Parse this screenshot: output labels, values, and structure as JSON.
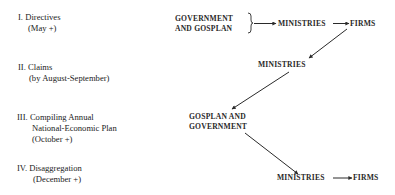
{
  "stages": [
    {
      "numeral": "I.",
      "title": "Directives",
      "timing": [
        "(May +)"
      ]
    },
    {
      "numeral": "II.",
      "title": "Claims",
      "timing": [
        "(by August-September)"
      ]
    },
    {
      "numeral": "III.",
      "title": "Compiling Annual",
      "timing": [
        "National-Economic Plan",
        "(October +)"
      ]
    },
    {
      "numeral": "IV.",
      "title": "Disaggregation",
      "timing": [
        "(December +)"
      ]
    }
  ],
  "nodes": {
    "gov_gosplan_line1": "GOVERNMENT",
    "gov_gosplan_line2": "AND GOSPLAN",
    "ministries_1": "MINISTRIES",
    "firms_1": "FIRMS",
    "ministries_2": "MINISTRIES",
    "gosplan_gov_line1": "GOSPLAN AND",
    "gosplan_gov_line2": "GOVERNMENT",
    "ministries_3": "MINISTRIES",
    "firms_2": "FIRMS"
  },
  "edges": [
    {
      "from": "GOVERNMENT AND GOSPLAN",
      "to": "MINISTRIES",
      "stage": "I"
    },
    {
      "from": "MINISTRIES",
      "to": "FIRMS",
      "stage": "I"
    },
    {
      "from": "FIRMS",
      "to": "MINISTRIES",
      "stage": "I→II"
    },
    {
      "from": "MINISTRIES",
      "to": "GOSPLAN AND GOVERNMENT",
      "stage": "II→III"
    },
    {
      "from": "GOSPLAN AND GOVERNMENT",
      "to": "MINISTRIES",
      "stage": "III→IV"
    },
    {
      "from": "MINISTRIES",
      "to": "FIRMS",
      "stage": "IV"
    }
  ]
}
